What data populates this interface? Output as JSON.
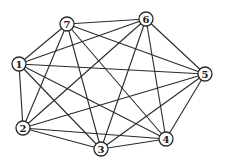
{
  "diagram": {
    "type": "graph",
    "colors": {
      "edge": "#2a2a2a",
      "node_fill": "#ffffff",
      "node_stroke": "#2a2a2a",
      "label": "#1a1a1a"
    },
    "node_radius": 7,
    "nodes": [
      {
        "id": "1",
        "label": "1",
        "x": 19,
        "y": 64
      },
      {
        "id": "2",
        "label": "2",
        "x": 23,
        "y": 128
      },
      {
        "id": "3",
        "label": "3",
        "x": 101,
        "y": 149
      },
      {
        "id": "4",
        "label": "4",
        "x": 166,
        "y": 139
      },
      {
        "id": "5",
        "label": "5",
        "x": 205,
        "y": 74
      },
      {
        "id": "6",
        "label": "6",
        "x": 146,
        "y": 19
      },
      {
        "id": "7",
        "label": "7",
        "x": 67,
        "y": 24
      }
    ],
    "edges": [
      [
        "1",
        "2"
      ],
      [
        "1",
        "3"
      ],
      [
        "1",
        "4"
      ],
      [
        "1",
        "5"
      ],
      [
        "1",
        "6"
      ],
      [
        "1",
        "7"
      ],
      [
        "2",
        "3"
      ],
      [
        "2",
        "4"
      ],
      [
        "2",
        "5"
      ],
      [
        "2",
        "6"
      ],
      [
        "2",
        "7"
      ],
      [
        "3",
        "4"
      ],
      [
        "3",
        "5"
      ],
      [
        "3",
        "6"
      ],
      [
        "3",
        "7"
      ],
      [
        "4",
        "5"
      ],
      [
        "4",
        "6"
      ],
      [
        "4",
        "7"
      ],
      [
        "5",
        "6"
      ],
      [
        "5",
        "7"
      ],
      [
        "6",
        "7"
      ]
    ]
  }
}
